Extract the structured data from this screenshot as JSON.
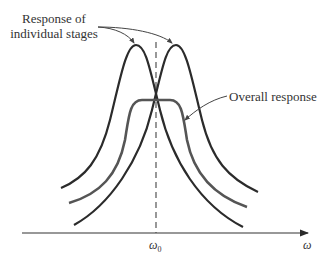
{
  "diagram": {
    "type": "frequency-response-sketch",
    "labels": {
      "individual_line1": "Response of",
      "individual_line2": "individual stages",
      "overall": "Overall response",
      "center_freq": "ω",
      "center_freq_sub": "0",
      "x_axis": "ω"
    },
    "elements": [
      {
        "name": "stage-1-response",
        "shape": "bell curve",
        "peak_x": "left of ω0"
      },
      {
        "name": "stage-2-response",
        "shape": "bell curve",
        "peak_x": "right of ω0"
      },
      {
        "name": "overall-response",
        "shape": "flat-top bandpass",
        "center": "ω0"
      },
      {
        "name": "center-frequency-marker",
        "shape": "dashed vertical line",
        "at": "ω0"
      }
    ],
    "colors": {
      "curves": "#2b2b2b",
      "overall": "#4a4a4a",
      "text": "#333333"
    }
  }
}
